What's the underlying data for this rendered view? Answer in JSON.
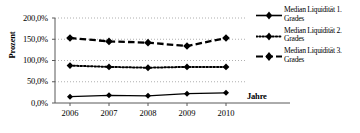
{
  "chart_data": {
    "type": "line",
    "title": "",
    "xlabel": "Jahre",
    "ylabel": "Prozent",
    "categories": [
      "2006",
      "2007",
      "2008",
      "2009",
      "2010"
    ],
    "x": [
      2006,
      2007,
      2008,
      2009,
      2010
    ],
    "ylim": [
      0,
      200
    ],
    "yticks": [
      0,
      50,
      100,
      150,
      200
    ],
    "ytick_labels": [
      "0,0%",
      "50,0%",
      "100,0%",
      "150,0%",
      "200,0%"
    ],
    "grid": true,
    "grid_style": "dotted-horizontal",
    "legend_position": "right",
    "series": [
      {
        "name": "Median Liquidität 1. Grades",
        "label_line1": "Median Liquidität 1.",
        "label_line2": "Grades",
        "style": "solid",
        "marker": "diamond",
        "color": "#000000",
        "values": [
          15.0,
          18.0,
          17.0,
          22.0,
          24.0
        ]
      },
      {
        "name": "Median Liquidität 2. Grades",
        "label_line1": "Median Liquidität 2.",
        "label_line2": "Grades",
        "style": "dotted",
        "marker": "diamond",
        "color": "#000000",
        "values": [
          88.0,
          85.0,
          83.0,
          85.0,
          85.0
        ]
      },
      {
        "name": "Median Liquidität 3. Grades",
        "label_line1": "Median Liquidität 3.",
        "label_line2": "Grades",
        "style": "dashed",
        "marker": "diamond",
        "color": "#000000",
        "values": [
          153.0,
          145.0,
          142.0,
          134.0,
          153.0
        ]
      }
    ]
  }
}
